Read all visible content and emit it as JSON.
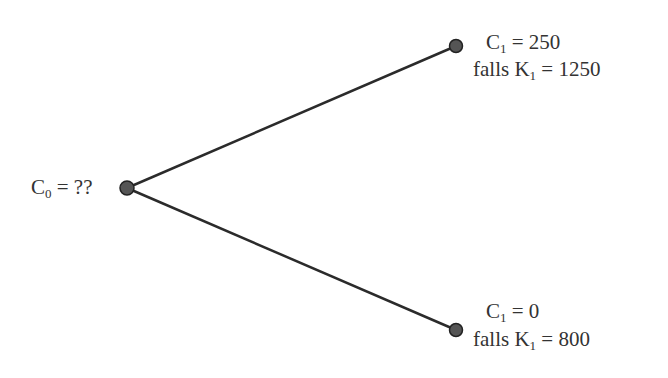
{
  "diagram": {
    "type": "binomial-tree",
    "root": {
      "label_var": "C",
      "label_sub": "0",
      "label_value": "= ??"
    },
    "up": {
      "label_var": "C",
      "label_sub": "1",
      "label_value": "= 250",
      "cond_prefix": "falls K",
      "cond_sub": "1",
      "cond_value": "= 1250"
    },
    "down": {
      "label_var": "C",
      "label_sub": "1",
      "label_value": "= 0",
      "cond_prefix": "falls K",
      "cond_sub": "1",
      "cond_value": "= 800"
    },
    "colors": {
      "line": "#2b2b2b",
      "node_fill": "#555555",
      "node_stroke": "#222222",
      "text": "#333333"
    }
  }
}
